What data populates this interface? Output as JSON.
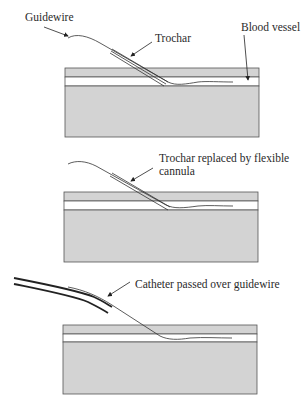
{
  "figure": {
    "panels": [
      {
        "id": "step-1",
        "labels": {
          "guidewire": "Guidewire",
          "trochar": "Trochar",
          "blood_vessel": "Blood vessel"
        }
      },
      {
        "id": "step-2",
        "labels": {
          "line1": "Trochar replaced by flexible",
          "line2": "cannula"
        }
      },
      {
        "id": "step-3",
        "labels": {
          "catheter": "Catheter passed over guidewire"
        }
      }
    ],
    "colors": {
      "tissue_fill": "#d3d3d3",
      "outline": "#555555",
      "lumen": "#ffffff",
      "wire": "#333333"
    }
  }
}
